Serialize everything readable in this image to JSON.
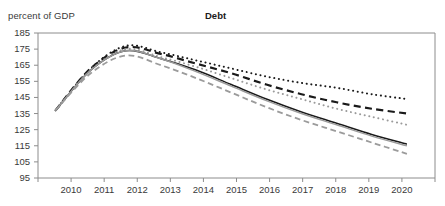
{
  "supertitle": "",
  "header": {
    "axis_unit_label": "percent of GDP",
    "title": "Debt"
  },
  "axes": {
    "y_ticks": [
      "185",
      "175",
      "165",
      "155",
      "145",
      "135",
      "125",
      "115",
      "105",
      "95"
    ],
    "x_ticks": [
      "2010",
      "2011",
      "2012",
      "2013",
      "2014",
      "2015",
      "2016",
      "2017",
      "2018",
      "2019",
      "2020"
    ]
  },
  "colors": {
    "dark_line": "#1a1a1a",
    "gray_line": "#9b9b9b",
    "axis": "#8c8c8c",
    "text": "#3a3a3a"
  },
  "chart_data": {
    "type": "line",
    "title": "Debt",
    "xlabel": "",
    "ylabel": "percent of GDP",
    "x": [
      2010,
      2011,
      2012,
      2013,
      2014,
      2015,
      2016,
      2017,
      2018,
      2019,
      2020
    ],
    "xlim": [
      2009.5,
      2020.8
    ],
    "ylim": [
      95,
      185
    ],
    "ytick_step": 10,
    "grid": false,
    "legend": "none",
    "series": [
      {
        "name": "scenario-dotted-dark",
        "style": "dotted",
        "color": "#1a1a1a",
        "width": 2.0,
        "values": [
          137,
          163,
          177,
          173,
          168,
          163,
          158,
          154,
          151,
          147,
          144
        ]
      },
      {
        "name": "scenario-dashed-dark",
        "style": "dashed",
        "color": "#1a1a1a",
        "width": 2.2,
        "values": [
          137,
          163,
          176,
          172,
          166,
          160,
          153,
          147,
          142,
          138,
          135
        ]
      },
      {
        "name": "scenario-dotted-gray",
        "style": "dotted",
        "color": "#9b9b9b",
        "width": 2.0,
        "values": [
          137,
          162,
          175,
          170,
          164,
          157,
          150,
          144,
          138,
          133,
          128
        ]
      },
      {
        "name": "scenario-solid-dark",
        "style": "solid",
        "color": "#1a1a1a",
        "width": 1.5,
        "values": [
          137,
          162,
          174,
          169,
          162,
          153,
          144,
          136,
          129,
          122,
          116
        ]
      },
      {
        "name": "scenario-solid-gray",
        "style": "solid",
        "color": "#9b9b9b",
        "width": 1.5,
        "values": [
          137,
          162,
          174,
          169,
          161,
          152,
          143,
          135,
          128,
          121,
          115
        ]
      },
      {
        "name": "scenario-dashed-gray",
        "style": "dashed",
        "color": "#9b9b9b",
        "width": 1.8,
        "values": [
          137,
          160,
          171,
          165,
          157,
          148,
          139,
          131,
          124,
          117,
          110
        ]
      }
    ]
  }
}
